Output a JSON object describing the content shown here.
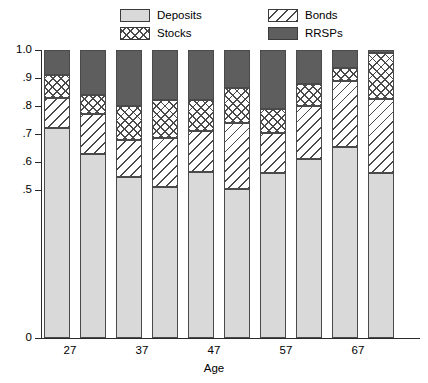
{
  "chart_data": {
    "type": "bar",
    "subtype": "stacked-bar-100-percent",
    "title": "",
    "xlabel": "Age",
    "ylabel": "",
    "ylim": [
      0,
      1.0
    ],
    "y_axis_broken": true,
    "grid": false,
    "legend_position": "top",
    "categories": [
      "27",
      "32",
      "37",
      "42",
      "47",
      "52",
      "57",
      "62",
      "67",
      "72"
    ],
    "tick_labels_shown": [
      "27",
      "",
      "37",
      "",
      "47",
      "",
      "57",
      "",
      "67",
      ""
    ],
    "ytick_labels": [
      "1.0",
      ".9",
      ".8",
      ".7",
      ".6",
      ".5",
      "0"
    ],
    "ytick_values": [
      1.0,
      0.9,
      0.8,
      0.7,
      0.6,
      0.5,
      0.0
    ],
    "series": [
      {
        "name": "Deposits",
        "fill": "solid-light-gray",
        "color": "#d9d9d9",
        "values": [
          0.72,
          0.63,
          0.545,
          0.51,
          0.565,
          0.505,
          0.56,
          0.61,
          0.655,
          0.56
        ]
      },
      {
        "name": "Bonds",
        "fill": "diagonal-hatch",
        "color": "#ffffff",
        "values": [
          0.11,
          0.14,
          0.135,
          0.175,
          0.145,
          0.235,
          0.145,
          0.19,
          0.235,
          0.265
        ]
      },
      {
        "name": "Stocks",
        "fill": "cross-hatch",
        "color": "#ffffff",
        "values": [
          0.08,
          0.07,
          0.12,
          0.135,
          0.11,
          0.125,
          0.085,
          0.08,
          0.045,
          0.165
        ]
      },
      {
        "name": "RRSPs",
        "fill": "solid-dark-gray",
        "color": "#5e5e5e",
        "values": [
          0.09,
          0.16,
          0.2,
          0.18,
          0.18,
          0.135,
          0.21,
          0.12,
          0.065,
          0.01
        ]
      }
    ],
    "cumulative_tops": {
      "deposits": [
        0.72,
        0.63,
        0.545,
        0.51,
        0.565,
        0.505,
        0.56,
        0.61,
        0.655,
        0.56
      ],
      "bonds": [
        0.83,
        0.77,
        0.68,
        0.685,
        0.71,
        0.74,
        0.705,
        0.8,
        0.89,
        0.825
      ],
      "stocks": [
        0.91,
        0.84,
        0.8,
        0.82,
        0.82,
        0.865,
        0.79,
        0.88,
        0.935,
        0.99
      ],
      "rrsps": [
        1.0,
        1.0,
        1.0,
        1.0,
        1.0,
        1.0,
        1.0,
        1.0,
        1.0,
        1.0
      ]
    }
  },
  "legend": {
    "items": [
      {
        "label": "Deposits",
        "swatch": "solid-light-gray"
      },
      {
        "label": "Bonds",
        "swatch": "diagonal-hatch"
      },
      {
        "label": "Stocks",
        "swatch": "cross-hatch"
      },
      {
        "label": "RRSPs",
        "swatch": "solid-dark-gray"
      }
    ]
  },
  "axes": {
    "x_title": "Age"
  },
  "colors": {
    "deposits": "#d9d9d9",
    "rrsps": "#5e5e5e",
    "hatch": "#4a4a4a",
    "axis": "#2a2a2a",
    "background": "#ffffff"
  }
}
